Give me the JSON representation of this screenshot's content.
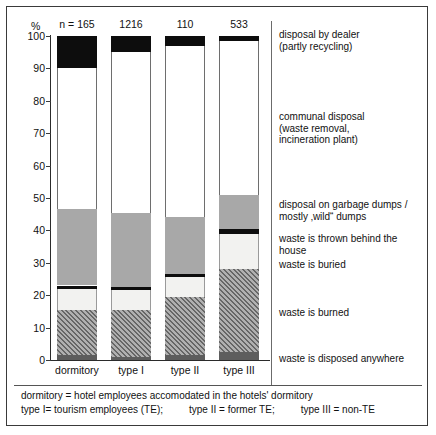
{
  "axis": {
    "unit_label": "%",
    "ticks": [
      "100",
      "90",
      "80",
      "70",
      "60",
      "50",
      "40",
      "30",
      "20",
      "10",
      "0"
    ],
    "n_prefix": "n = "
  },
  "footnote": {
    "line1": "dormitory = hotel employees accomodated in the hotels' dormitory",
    "line2_a": "type I= tourism employees (TE);",
    "line2_b": "type II = former TE;",
    "line2_c": "type III = non-TE"
  },
  "legend": [
    {
      "key": "dealer",
      "label": "disposal by dealer\n(partly recycling)"
    },
    {
      "key": "communal",
      "label": "communal disposal\n(waste removal,\nincineration plant)"
    },
    {
      "key": "dumps",
      "label": "disposal on garbage dumps /\nmostly ‚wild“ dumps"
    },
    {
      "key": "behind",
      "label": "waste is thrown behind the house"
    },
    {
      "key": "buried",
      "label": "waste is buried"
    },
    {
      "key": "burned",
      "label": "waste is burned"
    },
    {
      "key": "anywhere",
      "label": "waste is disposed anywhere"
    }
  ],
  "legend_lines": {
    "dealer_1": "disposal by dealer",
    "dealer_2": "(partly recycling)",
    "communal_1": "communal disposal",
    "communal_2": "(waste removal,",
    "communal_3": "incineration plant)",
    "dumps_1": "disposal on garbage dumps /",
    "dumps_2": "mostly ‚wild“ dumps",
    "behind_1": "waste is thrown behind the house",
    "buried_1": "waste is buried",
    "burned_1": "waste is burned",
    "anywhere_1": "waste is disposed anywhere"
  },
  "chart_data": {
    "type": "bar",
    "subtype": "stacked-100-percent",
    "title": "",
    "xlabel": "",
    "ylabel": "%",
    "ylim": [
      0,
      100
    ],
    "yticks": [
      0,
      10,
      20,
      30,
      40,
      50,
      60,
      70,
      80,
      90,
      100
    ],
    "grid": false,
    "legend_position": "right",
    "categories": [
      "dormitory",
      "type I",
      "type II",
      "type III"
    ],
    "sample_sizes": [
      165,
      1216,
      110,
      533
    ],
    "sample_size_labels": [
      "n = 165",
      "1216",
      "110",
      "533"
    ],
    "series": [
      {
        "name": "waste is disposed anywhere",
        "key": "anywhere",
        "values": [
          1.5,
          1.0,
          1.5,
          2.5
        ]
      },
      {
        "name": "waste is burned",
        "key": "burned",
        "values": [
          14.0,
          14.5,
          18.0,
          25.5
        ]
      },
      {
        "name": "waste is buried",
        "key": "buried",
        "values": [
          6.5,
          6.0,
          6.0,
          11.0
        ]
      },
      {
        "name": "waste is thrown behind the house",
        "key": "behind",
        "values": [
          1.0,
          1.0,
          1.0,
          1.5
        ]
      },
      {
        "name": "disposal on garbage dumps / mostly ‚wild“ dumps",
        "key": "dumps",
        "values": [
          23.5,
          23.0,
          17.5,
          10.5
        ]
      },
      {
        "name": "communal disposal (waste removal, incineration plant)",
        "key": "communal",
        "values": [
          43.5,
          49.5,
          53.0,
          47.5
        ]
      },
      {
        "name": "disposal by dealer (partly recycling)",
        "key": "dealer",
        "values": [
          10.0,
          5.0,
          3.0,
          1.5
        ]
      }
    ],
    "stack_order_bottom_to_top": [
      "anywhere",
      "burned",
      "buried",
      "behind",
      "dumps",
      "communal",
      "dealer"
    ],
    "colors": {
      "dealer": "#0d0d0d",
      "communal": "#ffffff",
      "dumps": "#a8a8a8",
      "behind": "#0d0d0d",
      "buried": "#f2f2f0",
      "burned": "#8e8e8e",
      "anywhere": "#5d5d5d"
    }
  }
}
